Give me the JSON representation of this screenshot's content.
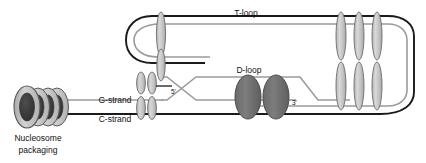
{
  "figure": {
    "background": "#ffffff"
  },
  "labels": {
    "t_loop": "T-loop",
    "d_loop": "D-loop",
    "g_strand": "G-strand",
    "c_strand": "C-strand",
    "five_prime": "5'",
    "three_prime": "3'",
    "nucleosome_line1": "Nucleosome",
    "nucleosome_line2": "packaging"
  },
  "colors": {
    "dna_dark_strand": "#1a1a1a",
    "dna_light_strand": "#9a9a9a",
    "protein_light_fill": "#c9c9c9",
    "protein_light_stroke": "#6d6d6d",
    "protein_dark_fill": "#6e6e6e",
    "protein_dark_stroke": "#4a4a4a",
    "nucleosome_outer_fill": "#c0c0c0",
    "nucleosome_inner_fill": "#3b3b3b",
    "nucleosome_stroke": "#5a5a5a",
    "text": "#111111"
  },
  "elements": {
    "nucleosome_count": 4,
    "t_loop_telomere_proteins": 3,
    "junction_proteins_upper": 2,
    "junction_proteins_lower": 2,
    "d_loop_proteins": 2,
    "tall_junction_protein": 1
  }
}
